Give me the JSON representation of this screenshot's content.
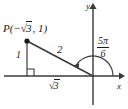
{
  "figure": {
    "type": "coordinate-plane-right-triangle",
    "background": "#ffffff",
    "stroke_color": "#3a3a3a",
    "text_color": "#1a1a1a"
  },
  "axes": {
    "x_label": "x",
    "y_label": "y",
    "origin": {
      "x": 93,
      "y": 76
    },
    "x_axis": {
      "x1": 4,
      "y1": 76,
      "x2": 122,
      "y2": 76,
      "arrow": "right"
    },
    "y_axis": {
      "x1": 93,
      "y1": 104,
      "x2": 93,
      "y2": 5,
      "arrow": "up"
    }
  },
  "point": {
    "label_full": "P(−√3, 1)",
    "name": "P",
    "open_paren": "(",
    "x_value": "−√3",
    "comma": ", ",
    "y_value": "1",
    "close_paren": ")",
    "position": {
      "x": 27,
      "y": 41
    }
  },
  "triangle": {
    "vertical_leg_label": "1",
    "hypotenuse_label": "2",
    "horizontal_leg_label": "√3",
    "right_angle_vertex": {
      "x": 27,
      "y": 76
    },
    "has_right_angle_marker": true
  },
  "angle": {
    "numerator": "5π",
    "denominator": "6",
    "value_label": "5π/6",
    "measure_radians": 2.6179938779914944,
    "arc_start_deg": 0,
    "arc_end_deg": 150,
    "arrowhead": "at-terminal-ray"
  }
}
